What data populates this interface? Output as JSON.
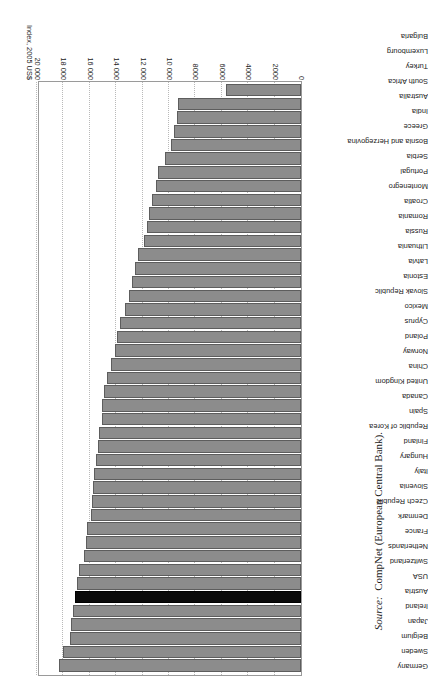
{
  "figure": {
    "axis_title": "Index, 2005 US$",
    "source_prefix": "Source:",
    "source_text": "CompNet (European Central Bank).",
    "highlight_country": "Austria",
    "highlight_color": "#0a0a0a",
    "bar_color": "#8c8c8c",
    "orientation": "rotated-180"
  },
  "chart_data": {
    "type": "bar",
    "title": "",
    "xlabel": "Index, 2005 US$",
    "ylabel": "",
    "xlim": [
      0,
      20000
    ],
    "grid": true,
    "legend": "none",
    "orientation": "horizontal",
    "tick_labels": [
      "0",
      "2000",
      "4000",
      "6000",
      "8000",
      "10 000",
      "12 000",
      "14 000",
      "16 000",
      "18 000",
      "20 000"
    ],
    "tick_values": [
      0,
      2000,
      4000,
      6000,
      8000,
      10000,
      12000,
      14000,
      16000,
      18000,
      20000
    ],
    "categories": [
      "Germany",
      "Sweden",
      "Belgium",
      "Japan",
      "Ireland",
      "Austria",
      "USA",
      "Switzerland",
      "Netherlands",
      "France",
      "Denmark",
      "Czech Republic",
      "Slovenia",
      "Italy",
      "Hungary",
      "Finland",
      "Republic of Korea",
      "Spain",
      "Canada",
      "United Kingdom",
      "China",
      "Norway",
      "Poland",
      "Cyprus",
      "Mexico",
      "Slovak Republic",
      "Estonia",
      "Latvia",
      "Lithuania",
      "Russia",
      "Romania",
      "Croatia",
      "Montenegro",
      "Portugal",
      "Serbia",
      "Bosnia and Herzegovina",
      "Greece",
      "India",
      "Australia",
      "South Africa",
      "Turkey",
      "Luxembourg",
      "Bulgaria"
    ],
    "values": [
      18300,
      18000,
      17500,
      17400,
      17300,
      17150,
      17000,
      16850,
      16450,
      16300,
      16200,
      15900,
      15800,
      15750,
      15650,
      15550,
      15400,
      15300,
      15100,
      15050,
      14900,
      14700,
      14400,
      14100,
      13950,
      13700,
      13300,
      13000,
      12800,
      12600,
      12350,
      11900,
      11700,
      11500,
      11300,
      11000,
      10800,
      10300,
      9850,
      9650,
      9400,
      9300,
      5700
    ]
  }
}
